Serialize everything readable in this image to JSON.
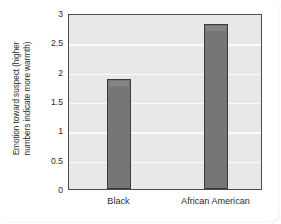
{
  "chart_data": {
    "type": "bar",
    "title": "",
    "subtitle": "",
    "xlabel": "",
    "ylabel": "Emotion toward suspect (higher numbers indicate more warmth)",
    "ylabel_lines": [
      "Emotion toward suspect (higher",
      "numbers indicate more warmth)"
    ],
    "categories": [
      "Black",
      "African American"
    ],
    "values": [
      1.87,
      2.81
    ],
    "ylim": [
      0,
      3
    ],
    "ytick_labels": [
      "0",
      "0.5",
      "1",
      "1.5",
      "2",
      "2.5",
      "3"
    ],
    "ytick_values": [
      0,
      0.5,
      1,
      1.5,
      2,
      2.5,
      3
    ],
    "grid": true,
    "grid_orientation": "horizontal",
    "legend": false,
    "legend_position": "none",
    "colors": {
      "bar_fill": "#767676",
      "bar_border": "#3c3c3c",
      "plot_background": "#e8e8e8",
      "gridline": "#fbfbfb",
      "axis_border": "#4c4c4c",
      "text": "#2b2b2b",
      "page_background": "#ffffff"
    }
  }
}
